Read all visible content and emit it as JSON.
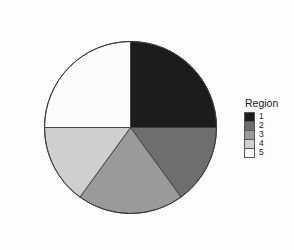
{
  "background_color": "#fdfdfd",
  "legend": {
    "title": "Region",
    "position": "right",
    "items": [
      {
        "label": "1",
        "color": "#1c1c1c"
      },
      {
        "label": "2",
        "color": "#6e6e6e"
      },
      {
        "label": "3",
        "color": "#9a9a9a"
      },
      {
        "label": "4",
        "color": "#cfcfcf"
      },
      {
        "label": "5",
        "color": "#fcfcfc"
      }
    ]
  },
  "chart_data": {
    "type": "pie",
    "title": "",
    "xlabel": "",
    "ylabel": "",
    "legend_title": "Region",
    "legend_position": "right",
    "grid": false,
    "start_angle_deg": 0,
    "direction": "clockwise",
    "categories": [
      "1",
      "2",
      "3",
      "4",
      "5"
    ],
    "values": [
      25,
      15,
      20,
      15,
      25
    ],
    "units": "percent",
    "angles_deg": [
      90,
      54,
      72,
      54,
      90
    ],
    "colors": [
      "#1c1c1c",
      "#6e6e6e",
      "#9a9a9a",
      "#cfcfcf",
      "#fcfcfc"
    ],
    "slice_border_color": "#3a3a3a",
    "center_px": {
      "x": 130,
      "y": 127
    },
    "radius_px": 86,
    "slices": [
      {
        "label": "1",
        "value": 25,
        "angle_deg": 90,
        "color": "#1c1c1c",
        "start_deg": 270,
        "end_deg": 360
      },
      {
        "label": "2",
        "value": 15,
        "angle_deg": 54,
        "color": "#6e6e6e",
        "start_deg": 216,
        "end_deg": 270
      },
      {
        "label": "3",
        "value": 20,
        "angle_deg": 72,
        "color": "#9a9a9a",
        "start_deg": 144,
        "end_deg": 216
      },
      {
        "label": "4",
        "value": 15,
        "angle_deg": 54,
        "color": "#cfcfcf",
        "start_deg": 90,
        "end_deg": 144
      },
      {
        "label": "5",
        "value": 25,
        "angle_deg": 90,
        "color": "#fcfcfc",
        "start_deg": 0,
        "end_deg": 90
      }
    ]
  }
}
